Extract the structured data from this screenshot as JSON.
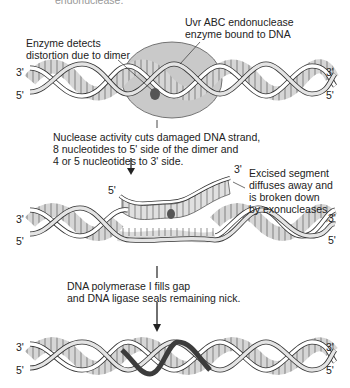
{
  "top_cutoff_text": "endonuclease.",
  "labels": {
    "uvr_enzyme": [
      "Uvr ABC endonuclease",
      "enzyme bound to DNA"
    ],
    "detects": [
      "Enzyme detects",
      "distortion due to dimer"
    ],
    "nuclease_activity": [
      "Nuclease activity cuts damaged DNA strand,",
      "8 nucleotides to 5' side of the dimer and",
      "4 or 5 nucleotides to 3' side."
    ],
    "excised": [
      "Excised segment",
      "diffuses away and",
      "is broken down",
      "by exonucleases"
    ],
    "polymerase": [
      "DNA polymerase I fills gap",
      "and DNA ligase seals remaining nick."
    ]
  },
  "strand_ends": {
    "helix1": {
      "left_top": "3'",
      "left_bottom": "5'",
      "right_top": "3'",
      "right_bottom": "5'"
    },
    "excised_segment": {
      "left": "5'",
      "right": "3'"
    },
    "helix2": {
      "left_top": "3'",
      "left_bottom": "5'",
      "right_top": "3'",
      "right_bottom": "5'"
    },
    "helix3": {
      "left_top": "3'",
      "left_bottom": "5'",
      "right_top": "3'",
      "right_bottom": "5'"
    }
  },
  "colors": {
    "enzyme_fill": "#c8c8c8",
    "groove_fill": "#d9d9d9",
    "backbone": "#ffffff",
    "outline": "#333333",
    "dimer": "#555555",
    "new_strand": "#444444"
  }
}
